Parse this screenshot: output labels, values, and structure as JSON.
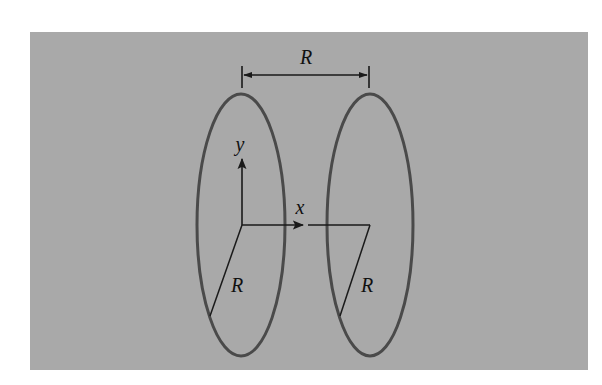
{
  "figure": {
    "background_color": "#a9a9a9",
    "line_color": "#1a1a1a",
    "ring_color": "#4a4a4a",
    "dimension_label": "R",
    "axis_labels": {
      "x": "x",
      "y": "y"
    },
    "radius_labels": [
      "R",
      "R"
    ],
    "elements": [
      {
        "type": "ring",
        "name": "left-loop",
        "cx": 241,
        "cy": 225,
        "rx": 44,
        "ry": 131
      },
      {
        "type": "ring",
        "name": "right-loop",
        "cx": 370,
        "cy": 225,
        "rx": 43,
        "ry": 131
      },
      {
        "type": "dimension",
        "name": "separation",
        "from_x": 242,
        "to_x": 369,
        "y": 75,
        "label": "R"
      },
      {
        "type": "axis",
        "name": "y-axis",
        "origin": [
          242,
          225
        ],
        "tip": [
          242,
          158
        ],
        "label": "y"
      },
      {
        "type": "axis",
        "name": "x-axis",
        "origin": [
          242,
          225
        ],
        "tip": [
          304,
          225
        ],
        "label": "x"
      },
      {
        "type": "radius",
        "name": "left-radius",
        "from": [
          242,
          225
        ],
        "to": [
          210,
          315
        ],
        "label": "R"
      },
      {
        "type": "radius",
        "name": "right-radius",
        "from": [
          370,
          225
        ],
        "to": [
          340,
          315
        ],
        "label": "R"
      }
    ]
  }
}
